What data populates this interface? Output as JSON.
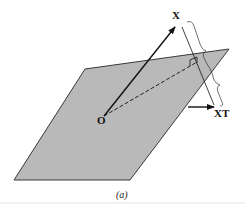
{
  "figure": {
    "caption": "(a)",
    "labels": {
      "origin": "O",
      "vector": "X",
      "projection": "XT"
    },
    "colors": {
      "plane_fill": "#b9b9b9",
      "plane_edge": "#3a3a3a",
      "ink": "#111111",
      "background": "#ffffff"
    }
  }
}
